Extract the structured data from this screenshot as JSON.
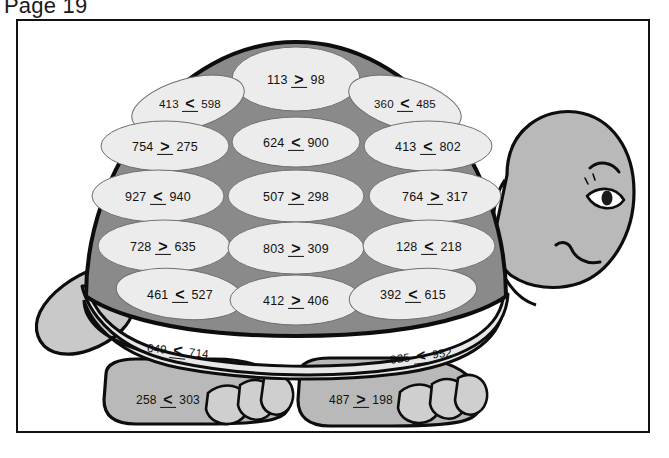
{
  "page": {
    "title": "Page 19"
  },
  "colors": {
    "ink": "#111111",
    "paper": "#ffffff",
    "shell_plate": "#ececec",
    "shell_gap": "#8a8a8a",
    "shell_rim": "#e8e8e8",
    "body_gray": "#b9b9b9",
    "outline": "#0d0d0d"
  },
  "artwork": {
    "subject": "cartoon-turtle",
    "face": {
      "eye": "eye",
      "eyebrow": "eyebrow",
      "mouth": "smiling-mouth"
    },
    "parts": [
      "shell-dome",
      "shell-rim",
      "head",
      "tail",
      "front-leg",
      "back-leg"
    ]
  },
  "shell": {
    "description": "Turtle shell with inequality problems in each plate",
    "columns": {
      "top": [
        {
          "left": "113",
          "op": ">",
          "right": "98"
        }
      ],
      "left": [
        {
          "left": "413",
          "op": "<",
          "right": "598"
        },
        {
          "left": "754",
          "op": ">",
          "right": "275"
        },
        {
          "left": "927",
          "op": "<",
          "right": "940"
        },
        {
          "left": "728",
          "op": ">",
          "right": "635"
        },
        {
          "left": "461",
          "op": "<",
          "right": "527"
        }
      ],
      "middle": [
        {
          "left": "624",
          "op": "<",
          "right": "900"
        },
        {
          "left": "507",
          "op": ">",
          "right": "298"
        },
        {
          "left": "803",
          "op": ">",
          "right": "309"
        },
        {
          "left": "412",
          "op": ">",
          "right": "406"
        }
      ],
      "right": [
        {
          "left": "360",
          "op": "<",
          "right": "485"
        },
        {
          "left": "413",
          "op": "<",
          "right": "802"
        },
        {
          "left": "764",
          "op": ">",
          "right": "317"
        },
        {
          "left": "128",
          "op": "<",
          "right": "218"
        },
        {
          "left": "392",
          "op": "<",
          "right": "615"
        }
      ],
      "rim": [
        {
          "left": "649",
          "op": "<",
          "right": "714"
        },
        {
          "left": "925",
          "op": "<",
          "right": "952"
        }
      ]
    }
  },
  "legs": [
    {
      "name": "front-leg",
      "left": "258",
      "op": "<",
      "right": "303"
    },
    {
      "name": "back-leg",
      "left": "487",
      "op": ">",
      "right": "198"
    }
  ]
}
